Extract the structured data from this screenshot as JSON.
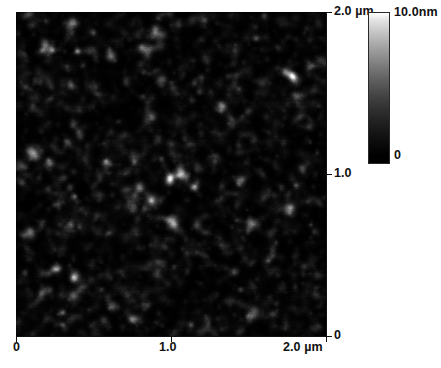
{
  "figure": {
    "kind": "afm-topography-micrograph",
    "scan_alt": "AFM topography scan of a nanogranular thin film surface"
  },
  "scan": {
    "x_axis": {
      "unit": "µm",
      "ticks": [
        {
          "value": "0",
          "label": "0"
        },
        {
          "value": "1.0",
          "label": "1.0"
        },
        {
          "value": "2.0",
          "label": "2.0 µm"
        }
      ]
    },
    "y_axis": {
      "unit": "µm",
      "ticks": [
        {
          "value": "0",
          "label": "0"
        },
        {
          "value": "1.0",
          "label": "1.0"
        },
        {
          "value": "2.0",
          "label": "2.0 µm"
        }
      ]
    }
  },
  "colorbar": {
    "max_label": "10.0nm",
    "min_label": "0",
    "high_color": "#ffffff",
    "low_color": "#000000"
  },
  "chart_data": {
    "type": "heatmap",
    "title": "",
    "subtitle": "",
    "xlabel": "",
    "ylabel": "",
    "xlim": [
      0,
      2.0
    ],
    "ylim": [
      0,
      2.0
    ],
    "x_unit": "µm",
    "y_unit": "µm",
    "xticks": [
      0,
      1.0,
      2.0
    ],
    "xticklabels": [
      "0",
      "1.0",
      "2.0 µm"
    ],
    "yticks": [
      0,
      1.0,
      2.0
    ],
    "yticklabels": [
      "0",
      "1.0",
      "2.0 µm"
    ],
    "grid": false,
    "legend": "colorbar-right",
    "colorbar": {
      "label": "",
      "unit": "nm",
      "vmin": 0,
      "vmax": 10.0,
      "vmin_label": "0",
      "vmax_label": "10.0nm",
      "colormap": "black-to-white linear grayscale"
    },
    "surface": {
      "description": "Dense nanogranular surface texture; many small bright grains on a dark background with a few brighter isolated peaks.",
      "mean_height_nm": 2.1,
      "rms_roughness_nm": 1.2,
      "typical_grain_diameter_nm": 45,
      "peak_height_nm": 10.0,
      "field_of_view_um": 2.0
    }
  }
}
